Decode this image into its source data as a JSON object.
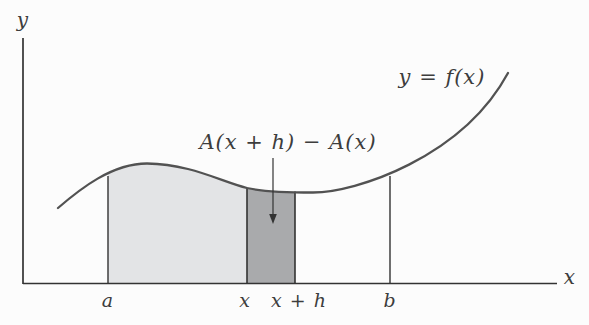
{
  "figure": {
    "y_axis_label": "y",
    "x_axis_label": "x",
    "curve_label": "y = f(x)",
    "area_annotation": "A(x + h) − A(x)",
    "ticks": {
      "a": "a",
      "x": "x",
      "x_plus_h": "x + h",
      "b": "b"
    },
    "colors": {
      "background": "#fcfcfc",
      "light_region": "#e3e4e6",
      "dark_region": "#a9aaac",
      "curve": "#525252",
      "axis": "#333333",
      "text": "#3d3d3d"
    }
  }
}
